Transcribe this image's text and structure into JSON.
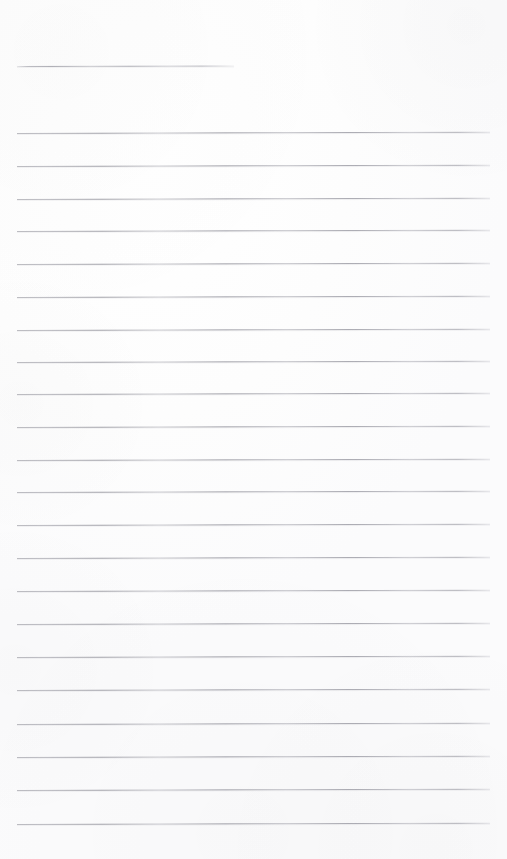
{
  "document": {
    "kind": "lined-paper-scan",
    "title": "Blank ruled notebook page",
    "page_label": "",
    "body_text": "",
    "width_px": 507,
    "height_px": 859,
    "colors": {
      "paper": "#fdfdfd",
      "rule_line": "#9a9aa2",
      "rule_line_light": "#c8c8cf",
      "page_edge": "#f6f6f7"
    },
    "ruling": {
      "line_count": 23,
      "line_spacing_px": 32.9,
      "line_thickness_px": 1,
      "left_margin_px": 17,
      "right_margin_px": 490,
      "tilt_deg": -0.16,
      "has_vertical_margin_rule": false,
      "has_holes": false
    },
    "lines": [
      {
        "id": "rule-header",
        "index": 0,
        "y": 66,
        "x_start": 17,
        "x_end": 234,
        "variant": "short"
      },
      {
        "id": "rule-1",
        "index": 1,
        "y": 133,
        "x_start": 17,
        "x_end": 490,
        "variant": "full"
      },
      {
        "id": "rule-2",
        "index": 2,
        "y": 166,
        "x_start": 17,
        "x_end": 490,
        "variant": "full"
      },
      {
        "id": "rule-3",
        "index": 3,
        "y": 199,
        "x_start": 17,
        "x_end": 490,
        "variant": "full"
      },
      {
        "id": "rule-4",
        "index": 4,
        "y": 231,
        "x_start": 17,
        "x_end": 490,
        "variant": "full"
      },
      {
        "id": "rule-5",
        "index": 5,
        "y": 264,
        "x_start": 17,
        "x_end": 490,
        "variant": "full"
      },
      {
        "id": "rule-6",
        "index": 6,
        "y": 297,
        "x_start": 17,
        "x_end": 490,
        "variant": "full"
      },
      {
        "id": "rule-7",
        "index": 7,
        "y": 330,
        "x_start": 17,
        "x_end": 490,
        "variant": "full"
      },
      {
        "id": "rule-8",
        "index": 8,
        "y": 362,
        "x_start": 17,
        "x_end": 490,
        "variant": "full"
      },
      {
        "id": "rule-9",
        "index": 9,
        "y": 394,
        "x_start": 17,
        "x_end": 490,
        "variant": "full"
      },
      {
        "id": "rule-10",
        "index": 10,
        "y": 427,
        "x_start": 17,
        "x_end": 490,
        "variant": "full"
      },
      {
        "id": "rule-11",
        "index": 11,
        "y": 460,
        "x_start": 17,
        "x_end": 490,
        "variant": "full"
      },
      {
        "id": "rule-12",
        "index": 12,
        "y": 492,
        "x_start": 17,
        "x_end": 490,
        "variant": "full"
      },
      {
        "id": "rule-13",
        "index": 13,
        "y": 525,
        "x_start": 17,
        "x_end": 490,
        "variant": "full"
      },
      {
        "id": "rule-14",
        "index": 14,
        "y": 558,
        "x_start": 17,
        "x_end": 490,
        "variant": "full"
      },
      {
        "id": "rule-15",
        "index": 15,
        "y": 591,
        "x_start": 17,
        "x_end": 490,
        "variant": "full"
      },
      {
        "id": "rule-16",
        "index": 16,
        "y": 624,
        "x_start": 17,
        "x_end": 490,
        "variant": "full"
      },
      {
        "id": "rule-17",
        "index": 17,
        "y": 657,
        "x_start": 17,
        "x_end": 490,
        "variant": "full"
      },
      {
        "id": "rule-18",
        "index": 18,
        "y": 690,
        "x_start": 17,
        "x_end": 490,
        "variant": "full"
      },
      {
        "id": "rule-19",
        "index": 19,
        "y": 724,
        "x_start": 17,
        "x_end": 490,
        "variant": "full"
      },
      {
        "id": "rule-20",
        "index": 20,
        "y": 757,
        "x_start": 17,
        "x_end": 490,
        "variant": "full"
      },
      {
        "id": "rule-21",
        "index": 21,
        "y": 790,
        "x_start": 17,
        "x_end": 490,
        "variant": "full"
      },
      {
        "id": "rule-22",
        "index": 22,
        "y": 824,
        "x_start": 17,
        "x_end": 490,
        "variant": "full"
      }
    ]
  }
}
